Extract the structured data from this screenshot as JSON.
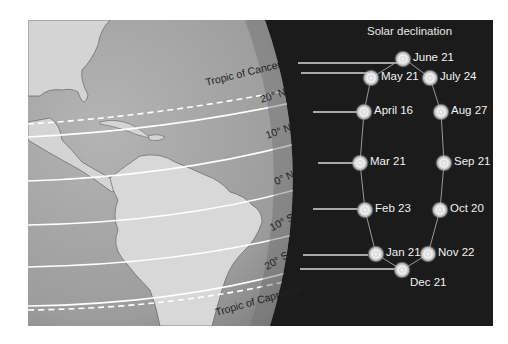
{
  "title": "Solar declination",
  "latitude_labels": [
    {
      "text": "Tropic of Cancer",
      "x": 207,
      "y": 88,
      "rot": -14
    },
    {
      "text": "20° N",
      "x": 262,
      "y": 105,
      "rot": -18
    },
    {
      "text": "10° N",
      "x": 268,
      "y": 141,
      "rot": -20
    },
    {
      "text": "0° N",
      "x": 277,
      "y": 187,
      "rot": -24
    },
    {
      "text": "10° S",
      "x": 273,
      "y": 233,
      "rot": -27
    },
    {
      "text": "20° S",
      "x": 268,
      "y": 272,
      "rot": -30
    },
    {
      "text": "Tropic of Capricom",
      "x": 217,
      "y": 318,
      "rot": -16
    }
  ],
  "dates": [
    {
      "label": "June 21",
      "x": 403,
      "y": 59,
      "side": "right"
    },
    {
      "label": "May 21",
      "x": 371,
      "y": 78,
      "side": "right"
    },
    {
      "label": "July 24",
      "x": 430,
      "y": 78,
      "side": "right"
    },
    {
      "label": "April 16",
      "x": 364,
      "y": 112,
      "side": "right"
    },
    {
      "label": "Aug 27",
      "x": 441,
      "y": 112,
      "side": "right"
    },
    {
      "label": "Mar 21",
      "x": 360,
      "y": 163,
      "side": "right"
    },
    {
      "label": "Sep 21",
      "x": 444,
      "y": 163,
      "side": "right"
    },
    {
      "label": "Feb 23",
      "x": 365,
      "y": 210,
      "side": "right"
    },
    {
      "label": "Oct 20",
      "x": 440,
      "y": 210,
      "side": "right"
    },
    {
      "label": "Jan 21",
      "x": 376,
      "y": 254,
      "side": "right"
    },
    {
      "label": "Nov 22",
      "x": 428,
      "y": 254,
      "side": "right"
    },
    {
      "label": "Dec 21",
      "x": 402,
      "y": 270,
      "side": "below"
    }
  ],
  "colors": {
    "background": "#1b1b1b",
    "ocean": "#9a9a9a",
    "land": "#d6d6d6",
    "lines": "#ffffff",
    "dot_glow": "#f5f5f5"
  }
}
